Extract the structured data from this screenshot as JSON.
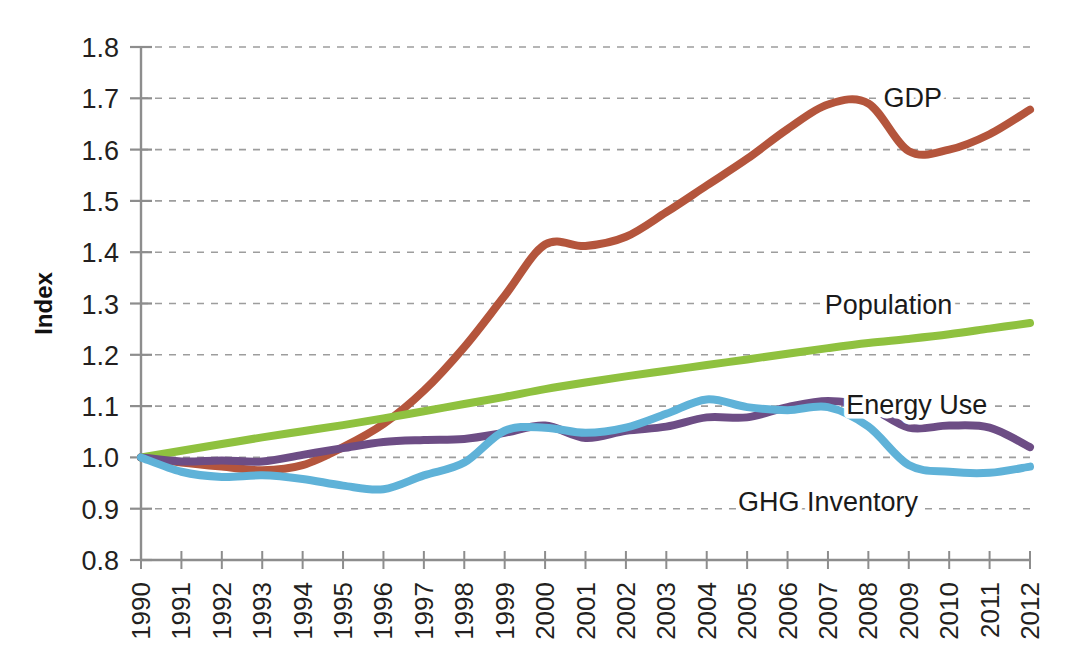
{
  "chart_data": {
    "type": "line",
    "title": "",
    "xlabel": "",
    "ylabel": "Index",
    "xlim": [
      1990,
      2012
    ],
    "ylim": [
      0.8,
      1.8
    ],
    "grid": true,
    "grid_axis": "y",
    "legend_position": "inline-right-of-lines",
    "x": [
      1990,
      1991,
      1992,
      1993,
      1994,
      1995,
      1996,
      1997,
      1998,
      1999,
      2000,
      2001,
      2002,
      2003,
      2004,
      2005,
      2006,
      2007,
      2008,
      2009,
      2010,
      2011,
      2012
    ],
    "categories": [
      "1990",
      "1991",
      "1992",
      "1993",
      "1994",
      "1995",
      "1996",
      "1997",
      "1998",
      "1999",
      "2000",
      "2001",
      "2002",
      "2003",
      "2004",
      "2005",
      "2006",
      "2007",
      "2008",
      "2009",
      "2010",
      "2011",
      "2012"
    ],
    "yticks": [
      0.8,
      0.9,
      1.0,
      1.1,
      1.2,
      1.3,
      1.4,
      1.5,
      1.6,
      1.7,
      1.8
    ],
    "ytick_labels": [
      "0.8",
      "0.9",
      "1.0",
      "1.1",
      "1.2",
      "1.3",
      "1.4",
      "1.5",
      "1.6",
      "1.7",
      "1.8"
    ],
    "series": [
      {
        "name": "GDP",
        "color": "#b4553c",
        "label_x": 2009.1,
        "label_y": 1.7,
        "values": [
          1.0,
          0.99,
          0.982,
          0.975,
          0.985,
          1.02,
          1.065,
          1.13,
          1.215,
          1.315,
          1.415,
          1.412,
          1.43,
          1.478,
          1.53,
          1.582,
          1.64,
          1.688,
          1.69,
          1.597,
          1.6,
          1.63,
          1.678
        ]
      },
      {
        "name": "Population",
        "color": "#8fc13f",
        "label_x": 2008.5,
        "label_y": 1.298,
        "values": [
          1.0,
          1.013,
          1.026,
          1.039,
          1.051,
          1.063,
          1.076,
          1.09,
          1.104,
          1.118,
          1.133,
          1.146,
          1.158,
          1.169,
          1.18,
          1.191,
          1.202,
          1.213,
          1.223,
          1.231,
          1.24,
          1.251,
          1.262
        ]
      },
      {
        "name": "Energy Use",
        "color": "#6d4d85",
        "label_x": 2009.2,
        "label_y": 1.103,
        "values": [
          1.0,
          0.992,
          0.994,
          0.992,
          1.005,
          1.018,
          1.03,
          1.034,
          1.036,
          1.048,
          1.062,
          1.038,
          1.052,
          1.06,
          1.078,
          1.078,
          1.098,
          1.11,
          1.098,
          1.058,
          1.062,
          1.058,
          1.02
        ]
      },
      {
        "name": "GHG Inventory",
        "color": "#5fb2d8",
        "label_x": 2007.0,
        "label_y": 0.913,
        "values": [
          1.0,
          0.972,
          0.962,
          0.965,
          0.958,
          0.945,
          0.938,
          0.965,
          0.99,
          1.052,
          1.058,
          1.048,
          1.058,
          1.085,
          1.113,
          1.098,
          1.092,
          1.098,
          1.06,
          0.985,
          0.972,
          0.97,
          0.982
        ]
      }
    ]
  },
  "axis": {
    "y_title": "Index"
  }
}
